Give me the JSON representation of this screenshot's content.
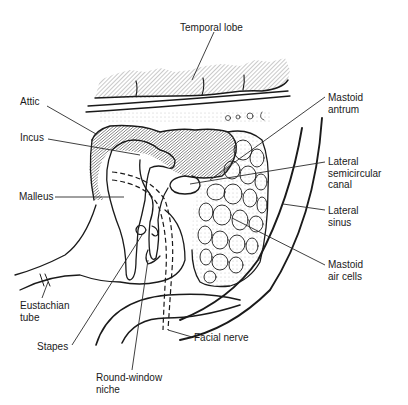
{
  "diagram": {
    "labels": {
      "temporal_lobe": "Temporal lobe",
      "attic": "Attic",
      "incus": "Incus",
      "malleus": "Malleus",
      "eustachian_tube": "Eustachian\ntube",
      "stapes": "Stapes",
      "round_window_niche": "Round-window\nniche",
      "facial_nerve": "Facial nerve",
      "mastoid_antrum": "Mastoid\nantrum",
      "lateral_semicircular_canal": "Lateral\nsemicircular\ncanal",
      "lateral_sinus": "Lateral\nsinus",
      "mastoid_air_cells": "Mastoid\nair cells"
    },
    "colors": {
      "line": "#1a1a1a",
      "background": "#ffffff",
      "hatch": "#555555"
    }
  }
}
